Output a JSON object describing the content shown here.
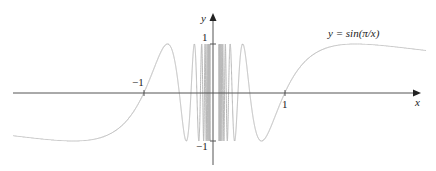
{
  "chart_data": {
    "type": "line",
    "title": "",
    "function": "y = sin(π/x)",
    "xlabel": "x",
    "ylabel": "y",
    "xlim": [
      -3.0,
      3.0
    ],
    "ylim": [
      -1,
      1
    ],
    "x_ticks": [
      {
        "value": -1,
        "label": "−1"
      },
      {
        "value": 1,
        "label": "1"
      }
    ],
    "y_ticks": [
      {
        "value": 1,
        "label": "1"
      },
      {
        "value": -1,
        "label": "−1"
      }
    ],
    "grid": false,
    "legend": null,
    "annotations": [
      {
        "text": "y = sin(π/x)",
        "position": "upper right, near curve"
      }
    ],
    "series": [
      {
        "name": "sin(pi/x)",
        "color": "#b8b8b8",
        "samples": [
          {
            "x": -3.0,
            "y": -0.866
          },
          {
            "x": -2.0,
            "y": -1.0
          },
          {
            "x": -1.5,
            "y": -0.866
          },
          {
            "x": -1.0,
            "y": 0.0
          },
          {
            "x": -0.667,
            "y": 1.0
          },
          {
            "x": -0.5,
            "y": 0.0
          },
          {
            "x": -0.4,
            "y": -1.0
          },
          {
            "x": 0.4,
            "y": 1.0
          },
          {
            "x": 0.5,
            "y": 0.0
          },
          {
            "x": 0.667,
            "y": -1.0
          },
          {
            "x": 1.0,
            "y": 0.0
          },
          {
            "x": 1.5,
            "y": 0.866
          },
          {
            "x": 2.0,
            "y": 1.0
          },
          {
            "x": 3.0,
            "y": 0.866
          }
        ]
      }
    ]
  },
  "labels": {
    "x_axis": "x",
    "y_axis": "y",
    "curve": "y = sin(π/x)",
    "x_tick_neg1": "−1",
    "x_tick_1": "1",
    "y_tick_1": "1",
    "y_tick_neg1": "−1"
  },
  "colors": {
    "axis": "#555555",
    "curve": "#b8b8b8",
    "text": "#222222"
  }
}
